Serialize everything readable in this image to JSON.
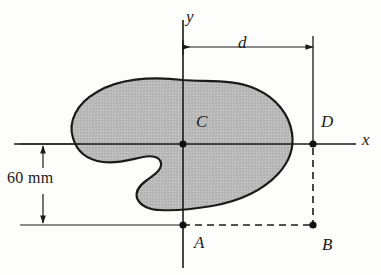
{
  "figure": {
    "background_color": "#fdfdfc",
    "line_color": "#1a1a1a",
    "shape_fill_color": "#b9b9b9",
    "shape_outline_color": "#1a1a1a"
  },
  "axes": {
    "y_label": "y",
    "x_label": "x",
    "origin_px": {
      "x": 183,
      "y": 144
    }
  },
  "dimensions": [
    {
      "name": "horizontal-distance-d",
      "label": "d",
      "from": "y-axis",
      "to": "point-D",
      "orientation": "horizontal"
    },
    {
      "name": "vertical-distance-60mm",
      "label": "60 mm",
      "value": 60,
      "unit": "mm",
      "from": "x-axis",
      "to": "line-AB",
      "orientation": "vertical"
    }
  ],
  "points": [
    {
      "id": "C",
      "label": "C",
      "description": "centroid of shaded area",
      "x_px": 183,
      "y_px": 144
    },
    {
      "id": "D",
      "label": "D",
      "description": "point on x-axis at distance d from y-axis",
      "x_px": 313,
      "y_px": 144
    },
    {
      "id": "A",
      "label": "A",
      "description": "point on y-axis 60 mm below x-axis",
      "x_px": 183,
      "y_px": 225
    },
    {
      "id": "B",
      "label": "B",
      "description": "point 60 mm below D",
      "x_px": 313,
      "y_px": 225
    }
  ],
  "shape": {
    "name": "palette-shaped-plane-area",
    "fill": "#b9b9b9",
    "stroke": "#1a1a1a",
    "stroke_width": 2.2,
    "path": "M 183 80 C 150 76 118 79 97 92 C 76 104 68 122 73 138 C 77 152 88 160 103 162 C 118 164 132 159 143 157 C 152 155 160 157 161 163 C 162 170 154 175 147 180 C 140 185 135 191 137 198 C 140 206 150 210 160 210 C 175 211 194 209 212 206 C 240 201 263 190 278 174 C 291 160 294 146 292 133 C 289 114 276 98 256 89 C 234 79 208 82 183 80 Z"
  }
}
